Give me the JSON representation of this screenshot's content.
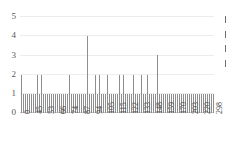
{
  "chart_data": {
    "type": "bar",
    "title": "",
    "subtitle": "",
    "xlabel": "",
    "ylabel": "",
    "ylim": [
      0,
      5
    ],
    "yticks": [
      "0",
      "1",
      "2",
      "3",
      "4",
      "5"
    ],
    "grid": true,
    "legend_position": "right",
    "xtick_labels": [
      "0",
      "45",
      "53",
      "66",
      "74",
      "87",
      "94",
      "105",
      "115",
      "122",
      "133",
      "148",
      "159",
      "170",
      "203",
      "220",
      "298"
    ],
    "xtick_indices": [
      0,
      6,
      12,
      18,
      24,
      30,
      36,
      42,
      48,
      54,
      60,
      66,
      72,
      78,
      84,
      90,
      96
    ],
    "categories": [
      "0",
      "1",
      "2",
      "3",
      "4",
      "5",
      "6",
      "7",
      "8",
      "9",
      "10",
      "11",
      "12",
      "13",
      "14",
      "15",
      "16",
      "17",
      "18",
      "19",
      "20",
      "21",
      "22",
      "23",
      "24",
      "25",
      "26",
      "27",
      "28",
      "29",
      "30",
      "31",
      "32",
      "33",
      "34",
      "35",
      "36",
      "37",
      "38",
      "39",
      "40",
      "41",
      "42",
      "43",
      "44",
      "45",
      "46",
      "47",
      "48",
      "49",
      "50",
      "51",
      "52",
      "53",
      "54",
      "55",
      "56",
      "57",
      "58",
      "59",
      "60",
      "61",
      "62",
      "63",
      "64",
      "65",
      "66",
      "67",
      "68",
      "69",
      "70",
      "71",
      "72",
      "73",
      "74",
      "75",
      "76",
      "77",
      "78",
      "79",
      "80",
      "81",
      "82",
      "83",
      "84",
      "85",
      "86",
      "87",
      "88",
      "89",
      "90",
      "91",
      "92",
      "93",
      "94",
      "95",
      "96"
    ],
    "values": [
      2,
      1,
      1,
      1,
      1,
      1,
      1,
      1,
      2,
      1,
      2,
      1,
      1,
      1,
      1,
      1,
      1,
      1,
      1,
      1,
      1,
      1,
      1,
      1,
      2,
      1,
      1,
      1,
      1,
      1,
      1,
      1,
      1,
      4,
      1,
      1,
      1,
      2,
      1,
      2,
      1,
      1,
      1,
      2,
      1,
      1,
      1,
      1,
      1,
      2,
      1,
      2,
      1,
      1,
      1,
      1,
      2,
      1,
      1,
      1,
      2,
      1,
      1,
      2,
      1,
      1,
      1,
      1,
      3,
      1,
      1,
      1,
      1,
      1,
      1,
      1,
      1,
      1,
      1,
      1,
      1,
      1,
      1,
      1,
      1,
      1,
      1,
      1,
      1,
      1,
      1,
      1,
      1,
      1,
      1,
      1,
      1
    ],
    "bar_color": "#8e8e8e",
    "grid_color": "#ededed",
    "axis_color": "#cfcfcf"
  },
  "legend": {
    "entries": [
      {
        "label": "",
        "mark": "line-mark"
      },
      {
        "label": "",
        "mark": "line-mark"
      },
      {
        "label": "",
        "mark": "line-mark"
      },
      {
        "label": "",
        "mark": "line-mark"
      }
    ]
  }
}
